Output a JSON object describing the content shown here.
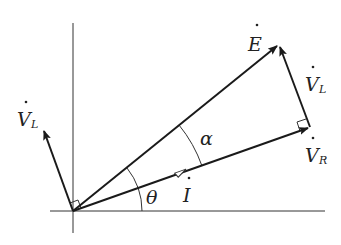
{
  "diagram": {
    "type": "phasor-diagram",
    "labels": {
      "E": "E",
      "V_L_top": "V",
      "V_L_top_sub": "L",
      "V_R": "V",
      "V_R_sub": "R",
      "V_L_left": "V",
      "V_L_left_sub": "L",
      "I": "I",
      "alpha": "α",
      "theta": "θ"
    },
    "colors": {
      "line": "#1a1a1a",
      "axis": "#333333",
      "background": "#ffffff"
    },
    "phasors": [
      {
        "name": "E",
        "from": [
          73,
          211
        ],
        "to": [
          279,
          44
        ]
      },
      {
        "name": "V_R",
        "from": [
          73,
          211
        ],
        "to": [
          310,
          127
        ]
      },
      {
        "name": "V_L",
        "from": [
          310,
          127
        ],
        "to": [
          279,
          44
        ]
      },
      {
        "name": "V_L_origin",
        "from": [
          73,
          211
        ],
        "to": [
          43,
          128
        ]
      }
    ]
  }
}
